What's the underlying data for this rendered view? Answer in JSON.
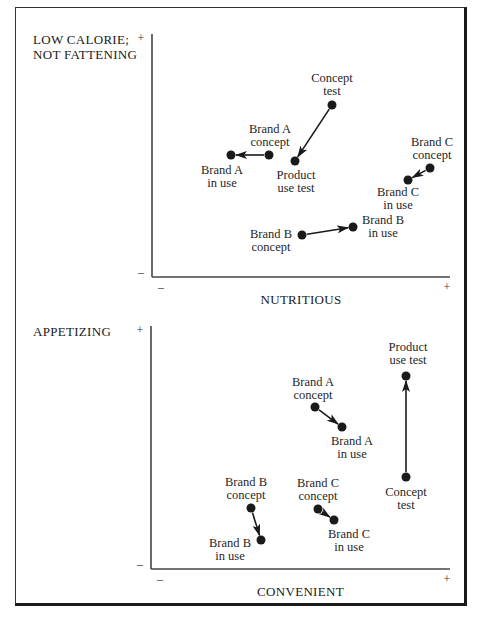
{
  "chart_data": [
    {
      "type": "scatter",
      "title": "",
      "xlabel": "NUTRITIOUS",
      "ylabel": "LOW CALORIE; NOT FATTENING",
      "ylabel_lines": [
        "LOW CALORIE;",
        "NOT FATTENING"
      ],
      "x_ticks": {
        "min": "–",
        "max": "+"
      },
      "y_ticks": {
        "min": "–",
        "max": "+"
      },
      "grid": false,
      "axes_px": {
        "ox": 152,
        "oy": 277,
        "xmax": 450,
        "ytop": 34
      },
      "points": [
        {
          "id": "concept_test",
          "label": [
            "Concept",
            "test"
          ],
          "x": 332,
          "y": 105,
          "lx": 332,
          "ly": 82,
          "anchor": "middle"
        },
        {
          "id": "product_use_test",
          "label": [
            "Product",
            "use test"
          ],
          "x": 295,
          "y": 161,
          "lx": 296,
          "ly": 179,
          "anchor": "middle"
        },
        {
          "id": "brand_a_concept",
          "label": [
            "Brand A",
            "concept"
          ],
          "x": 269,
          "y": 155,
          "lx": 270,
          "ly": 133,
          "anchor": "middle"
        },
        {
          "id": "brand_a_in_use",
          "label": [
            "Brand A",
            "in use"
          ],
          "x": 231,
          "y": 155,
          "lx": 222,
          "ly": 174,
          "anchor": "middle"
        },
        {
          "id": "brand_c_concept",
          "label": [
            "Brand C",
            "concept"
          ],
          "x": 430,
          "y": 168,
          "lx": 432,
          "ly": 146,
          "anchor": "middle"
        },
        {
          "id": "brand_c_in_use",
          "label": [
            "Brand C",
            "in use"
          ],
          "x": 408,
          "y": 180,
          "lx": 398,
          "ly": 196,
          "anchor": "middle"
        },
        {
          "id": "brand_b_concept",
          "label": [
            "Brand B",
            "concept"
          ],
          "x": 302,
          "y": 235,
          "lx": 271,
          "ly": 238,
          "anchor": "middle"
        },
        {
          "id": "brand_b_in_use",
          "label": [
            "Brand B",
            "in use"
          ],
          "x": 353,
          "y": 227,
          "lx": 383,
          "ly": 224,
          "anchor": "middle"
        }
      ],
      "arrows": [
        {
          "from": "concept_test",
          "to": "product_use_test"
        },
        {
          "from": "brand_a_concept",
          "to": "brand_a_in_use"
        },
        {
          "from": "brand_c_concept",
          "to": "brand_c_in_use"
        },
        {
          "from": "brand_b_concept",
          "to": "brand_b_in_use"
        }
      ]
    },
    {
      "type": "scatter",
      "title": "",
      "xlabel": "CONVENIENT",
      "ylabel": "APPETIZING",
      "ylabel_lines": [
        "APPETIZING"
      ],
      "x_ticks": {
        "min": "–",
        "max": "+"
      },
      "y_ticks": {
        "min": "–",
        "max": "+"
      },
      "grid": false,
      "axes_px": {
        "ox": 151,
        "oy": 569,
        "xmax": 450,
        "ytop": 326
      },
      "points": [
        {
          "id": "product_use_test",
          "label": [
            "Product",
            "use test"
          ],
          "x": 406,
          "y": 376,
          "lx": 408,
          "ly": 351,
          "anchor": "middle"
        },
        {
          "id": "concept_test",
          "label": [
            "Concept",
            "test"
          ],
          "x": 406,
          "y": 477,
          "lx": 406,
          "ly": 496,
          "anchor": "middle"
        },
        {
          "id": "brand_a_concept",
          "label": [
            "Brand A",
            "concept"
          ],
          "x": 315,
          "y": 407,
          "lx": 313,
          "ly": 386,
          "anchor": "middle"
        },
        {
          "id": "brand_a_in_use",
          "label": [
            "Brand A",
            "in use"
          ],
          "x": 342,
          "y": 427,
          "lx": 352,
          "ly": 445,
          "anchor": "middle"
        },
        {
          "id": "brand_b_concept",
          "label": [
            "Brand B",
            "concept"
          ],
          "x": 251,
          "y": 508,
          "lx": 246,
          "ly": 486,
          "anchor": "middle"
        },
        {
          "id": "brand_b_in_use",
          "label": [
            "Brand B",
            "in use"
          ],
          "x": 261,
          "y": 540,
          "lx": 230,
          "ly": 547,
          "anchor": "middle"
        },
        {
          "id": "brand_c_concept",
          "label": [
            "Brand C",
            "concept"
          ],
          "x": 318,
          "y": 509,
          "lx": 318,
          "ly": 487,
          "anchor": "middle"
        },
        {
          "id": "brand_c_in_use",
          "label": [
            "Brand C",
            "in use"
          ],
          "x": 334,
          "y": 520,
          "lx": 349,
          "ly": 538,
          "anchor": "middle"
        }
      ],
      "arrows": [
        {
          "from": "concept_test",
          "to": "product_use_test"
        },
        {
          "from": "brand_a_concept",
          "to": "brand_a_in_use"
        },
        {
          "from": "brand_b_concept",
          "to": "brand_b_in_use"
        },
        {
          "from": "brand_c_concept",
          "to": "brand_c_in_use"
        }
      ]
    }
  ],
  "colors": {
    "ink": "#1a1a1a",
    "paper": "#ffffff"
  }
}
